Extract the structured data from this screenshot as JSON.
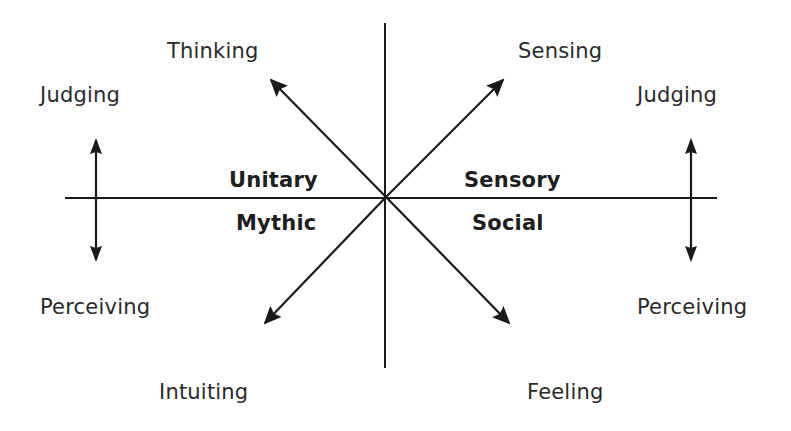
{
  "diagram": {
    "type": "axis-diagram",
    "colors": {
      "background": "#ffffff",
      "line": "#1a1a1a",
      "text": "#2a2a2a"
    },
    "axes": {
      "vertical": {
        "x": 385,
        "y1": 23,
        "y2": 368
      },
      "horizontal": {
        "y": 198,
        "x1": 65,
        "x2": 717
      }
    },
    "diagonal_arrows": [
      {
        "id": "thinking",
        "from": [
          386,
          197
        ],
        "to": [
          271,
          80
        ]
      },
      {
        "id": "sensing",
        "from": [
          386,
          197
        ],
        "to": [
          503,
          80
        ]
      },
      {
        "id": "intuiting",
        "from": [
          386,
          197
        ],
        "to": [
          265,
          323
        ]
      },
      {
        "id": "feeling",
        "from": [
          386,
          197
        ],
        "to": [
          509,
          323
        ]
      }
    ],
    "double_arrows": [
      {
        "id": "left-judging-perceiving",
        "x": 96,
        "y1": 140,
        "y2": 260
      },
      {
        "id": "right-judging-perceiving",
        "x": 691,
        "y1": 140,
        "y2": 260
      }
    ],
    "labels": {
      "thinking": "Thinking",
      "sensing": "Sensing",
      "judging_left": "Judging",
      "judging_right": "Judging",
      "perceiving_left": "Perceiving",
      "perceiving_right": "Perceiving",
      "intuiting": "Intuiting",
      "feeling": "Feeling"
    },
    "quadrant_labels": {
      "unitary": "Unitary",
      "mythic": "Mythic",
      "sensory": "Sensory",
      "social": "Social"
    }
  }
}
